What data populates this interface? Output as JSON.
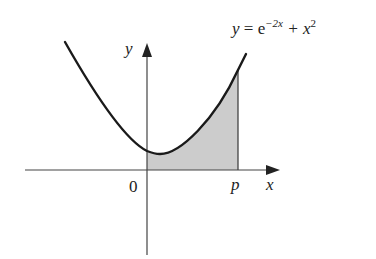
{
  "diagram": {
    "equation": {
      "y": "y",
      "equals": " = e",
      "exp": "−2x",
      "plus": " + x",
      "pow": "2"
    },
    "axis_labels": {
      "x": "x",
      "y": "y"
    },
    "tick_labels": {
      "origin": "0",
      "p": "p"
    },
    "colors": {
      "curve": "#1a1a1a",
      "axis": "#444444",
      "shade": "#cccccc"
    }
  }
}
